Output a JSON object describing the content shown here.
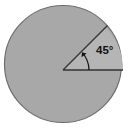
{
  "figure": {
    "kind": "circle-with-central-angle-diagram",
    "background_color": "#ffffff",
    "canvas": {
      "width": 128,
      "height": 134
    },
    "circle": {
      "name": "shaded-circle",
      "center_x": 63,
      "center_y": 64,
      "radius": 59,
      "fill_color": "#a8a8a8",
      "stroke_color": "#6e6e6e",
      "stroke_width": 1.2
    },
    "sector": {
      "name": "angle-sector",
      "start_angle_deg": 0,
      "end_angle_deg": 45,
      "fill_color": "#b5b5b5",
      "measure_deg": 45
    },
    "rays": [
      {
        "name": "horizontal-ray",
        "angle_deg": 0,
        "from_x": 63,
        "from_y": 70,
        "to_x": 123,
        "to_y": 70,
        "stroke_color": "#333333"
      },
      {
        "name": "upper-ray",
        "angle_deg": 45,
        "from_x": 63,
        "from_y": 70,
        "to_x": 108,
        "to_y": 26,
        "stroke_color": "#333333"
      }
    ],
    "angle_arc": {
      "name": "angle-arc-with-arrowhead",
      "radius": 26,
      "start_angle_deg": 0,
      "end_angle_deg": 42,
      "stroke_color": "#1a1a1a",
      "arrowhead": "pointing-counterclockwise"
    },
    "label": {
      "name": "angle-measure-label",
      "text": "45°",
      "value": 45,
      "unit": "degrees",
      "x": 96,
      "y": 54,
      "color": "#111111"
    }
  }
}
